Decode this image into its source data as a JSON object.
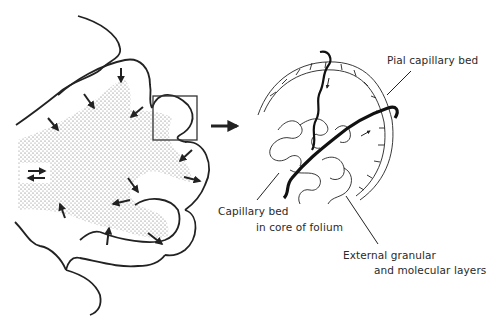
{
  "figure": {
    "type": "anatomical-diagram",
    "left_panel": {
      "description": "Cross-section of cerebellar folia with stippled white-matter core and inward/outward arrows",
      "inset_box": "Boxed region enlarged at right"
    },
    "connector_arrow": "right-arrow",
    "right_panel": {
      "description": "Enlarged folium showing capillary networks and vessels"
    },
    "labels": {
      "pial": "Pial capillary bed",
      "core_line1": "Capillary bed",
      "core_line2": "in core of folium",
      "external_line1": "External granular",
      "external_line2": "and molecular layers"
    }
  }
}
